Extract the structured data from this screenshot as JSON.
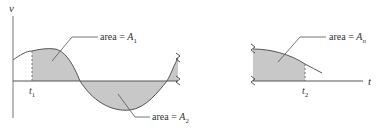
{
  "figure": {
    "axis_labels": {
      "vertical": "v",
      "horizontal": "t"
    },
    "time_markers": [
      {
        "name": "t",
        "sub": "1"
      },
      {
        "name": "t",
        "sub": "2"
      }
    ],
    "area_labels": [
      {
        "prefix": "area = ",
        "var": "A",
        "sub": "1"
      },
      {
        "prefix": "area = ",
        "var": "A",
        "sub": "2"
      },
      {
        "prefix": "area = ",
        "var": "A",
        "sub": "n"
      }
    ],
    "colors": {
      "fill": "#c8c8c8",
      "stroke": "#555555",
      "axis": "#666666",
      "text": "#333333"
    }
  }
}
